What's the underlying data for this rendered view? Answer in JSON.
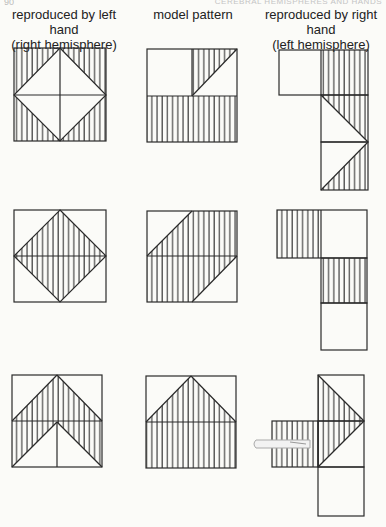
{
  "header": {
    "page_number": "90",
    "running_head": "CEREBRAL HEMISPHERES AND HANDS"
  },
  "columns": [
    {
      "line1": "reproduced by left hand",
      "line2": "(right hemisphere)"
    },
    {
      "line1": "model pattern",
      "line2": ""
    },
    {
      "line1": "reproduced by right hand",
      "line2": "(left hemisphere)"
    }
  ],
  "figure": {
    "stroke_color": "#2a2a2a",
    "hatch_color": "#333333",
    "rows": [
      {
        "left": "square with inscribed diamond; four corner triangles hatched",
        "model": "2x2 square; upper-right cell diagonal half hatched; bottom half hatched",
        "right": "disjointed cells arranged vertically; triangles detached"
      },
      {
        "left": "square with hatched inscribed diamond",
        "model": "parallelogram hatched across 2x2 square",
        "right": "staircase of cells; two hatched, one blank"
      },
      {
        "left": "chevron (arrow) shape hatched within 2x2 square",
        "model": "house/pentagon shape hatched within 2x2 square",
        "right": "arrow-like arrangement protruding to the right; pen visible"
      }
    ]
  }
}
